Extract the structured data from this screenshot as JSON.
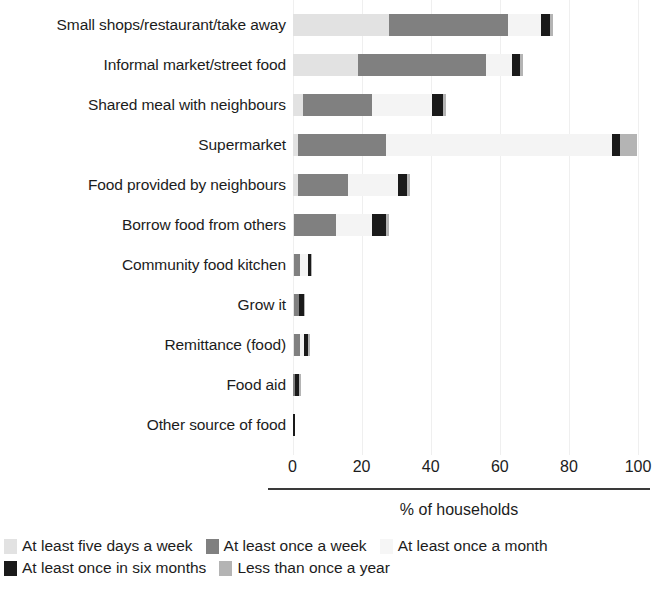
{
  "chart_data": {
    "type": "bar",
    "orientation": "horizontal",
    "stacked": true,
    "title": "",
    "xlabel": "% of households",
    "ylabel": "",
    "xlim": [
      0,
      100
    ],
    "xticks": [
      0,
      20,
      40,
      60,
      80,
      100
    ],
    "xtick_labels": [
      "0",
      "20",
      "40",
      "60",
      "80",
      "100"
    ],
    "grid": true,
    "legend_position": "bottom-left",
    "categories": [
      "Small shops/restaurant/take away",
      "Informal market/street food",
      "Shared meal with neighbours",
      "Supermarket",
      "Food provided by neighbours",
      "Borrow food from others",
      "Community food kitchen",
      "Grow it",
      "Remittance (food)",
      "Food aid",
      "Other source of food"
    ],
    "series": [
      {
        "name": "At least five days a week",
        "color": "#e2e2e2",
        "values": [
          28.0,
          19.0,
          3.0,
          1.5,
          1.5,
          0.5,
          0.3,
          0.3,
          0.3,
          0.2,
          0.2
        ]
      },
      {
        "name": "At least once a week",
        "color": "#808080",
        "values": [
          34.5,
          37.0,
          20.0,
          25.5,
          14.5,
          12.0,
          2.0,
          1.5,
          1.8,
          0.5,
          0.0
        ]
      },
      {
        "name": "At least once a month",
        "color": "#f4f4f4",
        "values": [
          9.5,
          7.5,
          17.5,
          65.5,
          14.5,
          10.5,
          2.3,
          0.2,
          1.2,
          0.0,
          0.0
        ]
      },
      {
        "name": "At least once in six months",
        "color": "#1a1a1a",
        "values": [
          2.6,
          2.4,
          3.0,
          2.3,
          2.6,
          4.0,
          0.7,
          1.3,
          1.3,
          1.3,
          0.5
        ]
      },
      {
        "name": "Less than once a year",
        "color": "#b4b4b4",
        "values": [
          0.7,
          0.8,
          0.8,
          5.0,
          1.0,
          0.8,
          0.2,
          0.2,
          0.2,
          0.2,
          0.0
        ]
      }
    ],
    "totals": [
      75.3,
      66.7,
      44.3,
      99.8,
      34.1,
      27.8,
      5.5,
      3.5,
      4.8,
      2.2,
      0.7
    ]
  },
  "legend": {
    "rows": [
      [
        {
          "label": "At least five days a week",
          "color": "#e2e2e2"
        },
        {
          "label": "At least once a week",
          "color": "#808080"
        },
        {
          "label": "At least once a month",
          "color": "#f6f6f6"
        }
      ],
      [
        {
          "label": "At least once in six months",
          "color": "#1a1a1a"
        },
        {
          "label": "Less than once a year",
          "color": "#b4b4b4"
        }
      ]
    ]
  }
}
